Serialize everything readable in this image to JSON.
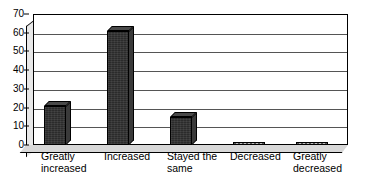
{
  "chart_data": {
    "type": "bar",
    "title": "",
    "subtitle": "",
    "xlabel": "",
    "ylabel": "",
    "categories": [
      "Greatly\nincreased",
      "Increased",
      "Stayed the\nsame",
      "Decreased",
      "Greatly\ndecreased"
    ],
    "values": [
      21,
      61,
      15,
      0,
      0
    ],
    "ylim": [
      0,
      70
    ],
    "ytick_labels": [
      "0",
      "10",
      "20",
      "30",
      "40",
      "50",
      "60",
      "70"
    ],
    "ytick_values": [
      0,
      10,
      20,
      30,
      40,
      50,
      60,
      70
    ],
    "grid": true,
    "legend": false,
    "legend_position": "none",
    "style": "3d-column",
    "bar_color": "#2b2b2b",
    "bar_top_color": "#4a4a4a",
    "bar_side_color": "#3a3a3a",
    "gridline_color": "#555555",
    "axis_color": "#000000",
    "background_color": "#ffffff"
  }
}
